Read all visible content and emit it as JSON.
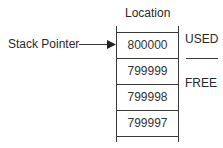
{
  "diagram": {
    "header": "Location",
    "pointer_label": "Stack Pointer",
    "cells": [
      "800000",
      "799999",
      "799998",
      "799997"
    ],
    "regions": {
      "used": "USED",
      "free": "FREE"
    }
  }
}
